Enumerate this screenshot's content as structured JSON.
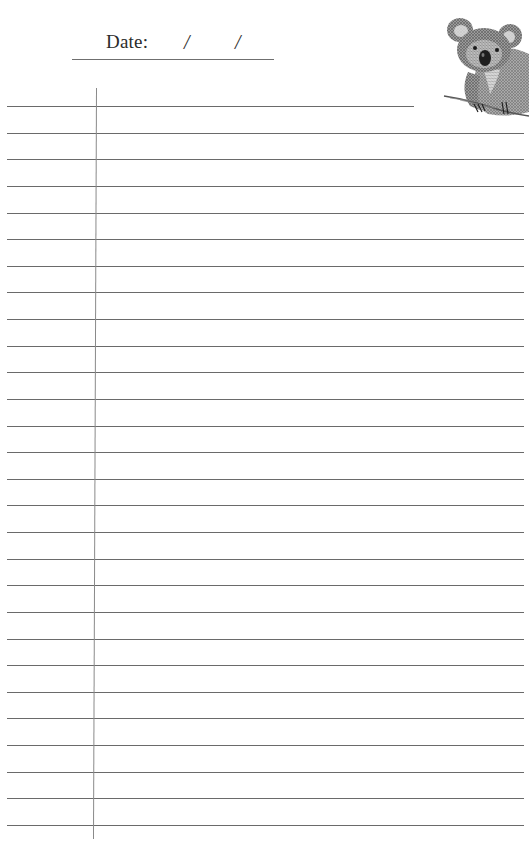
{
  "header": {
    "date_label": "Date:",
    "date_separator_1": "/",
    "date_separator_2": "/",
    "date_value": ""
  },
  "illustration": {
    "subject": "koala",
    "style": "pencil sketch"
  },
  "notebook": {
    "ruled_line_count": 28,
    "first_line_y": 106,
    "line_spacing": 26.63,
    "line_color": "#6a6a6a",
    "margin_line_color": "#8a8a8a",
    "lines": [
      "",
      "",
      "",
      "",
      "",
      "",
      "",
      "",
      "",
      "",
      "",
      "",
      "",
      "",
      "",
      "",
      "",
      "",
      "",
      "",
      "",
      "",
      "",
      "",
      "",
      "",
      "",
      ""
    ]
  }
}
